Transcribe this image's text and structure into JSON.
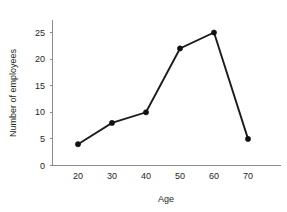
{
  "chart_data": {
    "type": "line",
    "title": "",
    "xlabel": "Age",
    "ylabel": "Number of employees",
    "x": [
      20,
      30,
      40,
      50,
      60,
      70
    ],
    "values": [
      4,
      8,
      10,
      22,
      25,
      5
    ],
    "series": [
      {
        "name": "Number of employees",
        "values": [
          4,
          8,
          10,
          22,
          25,
          5
        ]
      }
    ],
    "xticks": [
      "20",
      "30",
      "40",
      "50",
      "60",
      "70"
    ],
    "yticks": [
      "0",
      "5",
      "10",
      "15",
      "20",
      "25"
    ],
    "xlim": [
      15,
      75
    ],
    "ylim": [
      0,
      27.5
    ],
    "grid": false,
    "legend": false,
    "legend_position": "none",
    "marker": "filled-circle",
    "line_color": "#1b1b1b",
    "marker_color": "#111111",
    "axis_color": "#8c8c8c",
    "background_color": "#ffffff",
    "annotations": []
  }
}
